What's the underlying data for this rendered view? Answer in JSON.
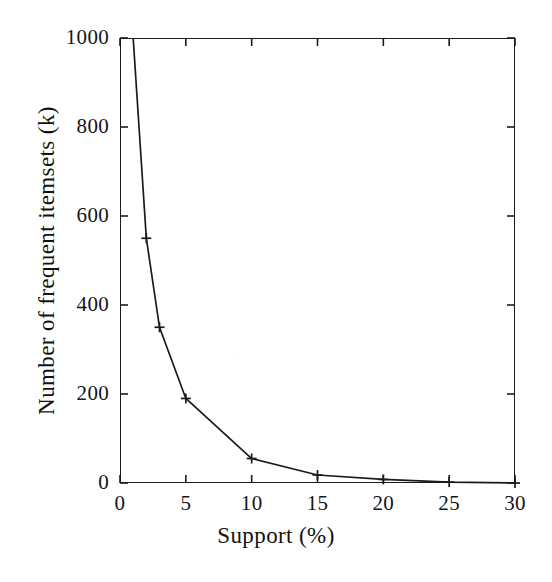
{
  "figure": {
    "background_color": "#ffffff",
    "line_color": "#1b1b1b",
    "text_color": "#121212"
  },
  "chart_data": {
    "type": "line",
    "title": "",
    "xlabel": "Support (%)",
    "ylabel": "Number of frequent itemsets (k)",
    "xlim": [
      0,
      30
    ],
    "ylim": [
      0,
      1000
    ],
    "xticks": [
      0,
      5,
      10,
      15,
      20,
      25,
      30
    ],
    "xtick_labels": [
      "0",
      "5",
      "10",
      "15",
      "20",
      "25",
      "30"
    ],
    "yticks": [
      0,
      200,
      400,
      600,
      800,
      1000
    ],
    "ytick_labels": [
      "0",
      "200",
      "400",
      "600",
      "800",
      "1000"
    ],
    "grid": false,
    "legend": false,
    "legend_position": "none",
    "marker": "plus",
    "tick_direction": "in",
    "frame": "full-box",
    "series": [
      {
        "name": "Number of frequent itemsets (k)",
        "x": [
          1,
          2,
          3,
          5,
          10,
          15,
          20,
          25,
          30
        ],
        "values": [
          1000,
          550,
          350,
          190,
          55,
          18,
          8,
          2,
          0
        ]
      }
    ]
  }
}
